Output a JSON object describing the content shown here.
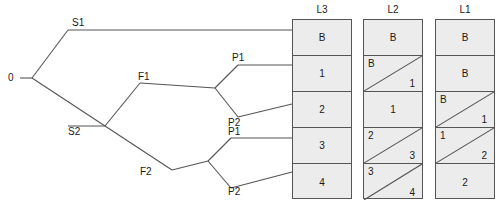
{
  "diagram": {
    "title": "",
    "line_color": "#555555",
    "cell_fill": "#ececec",
    "text_color": "#1a1a1a"
  },
  "tree": {
    "root": {
      "label": "0"
    },
    "nodes": [
      {
        "id": "S1",
        "label": "S1"
      },
      {
        "id": "S2",
        "label": "S2"
      },
      {
        "id": "F1",
        "label": "F1"
      },
      {
        "id": "F2",
        "label": "F2"
      },
      {
        "id": "P1a",
        "label": "P1"
      },
      {
        "id": "P2a",
        "label": "P2"
      },
      {
        "id": "P1b",
        "label": "P1"
      },
      {
        "id": "P2b",
        "label": "P2"
      }
    ]
  },
  "columns": [
    {
      "header": "L3",
      "cells": [
        {
          "type": "plain",
          "value": "B"
        },
        {
          "type": "plain",
          "value": "1"
        },
        {
          "type": "plain",
          "value": "2"
        },
        {
          "type": "plain",
          "value": "3"
        },
        {
          "type": "plain",
          "value": "4"
        }
      ]
    },
    {
      "header": "L2",
      "cells": [
        {
          "type": "plain",
          "value": "B"
        },
        {
          "type": "split",
          "top_left": "B",
          "bottom_right": "1"
        },
        {
          "type": "plain",
          "value": "1"
        },
        {
          "type": "split",
          "top_left": "2",
          "bottom_right": "3"
        },
        {
          "type": "split",
          "top_left": "3",
          "bottom_right": "4"
        }
      ]
    },
    {
      "header": "L1",
      "cells": [
        {
          "type": "plain",
          "value": "B"
        },
        {
          "type": "plain",
          "value": "B"
        },
        {
          "type": "split",
          "top_left": "B",
          "bottom_right": "1"
        },
        {
          "type": "split",
          "top_left": "1",
          "bottom_right": "2"
        },
        {
          "type": "plain",
          "value": "2"
        }
      ]
    }
  ]
}
